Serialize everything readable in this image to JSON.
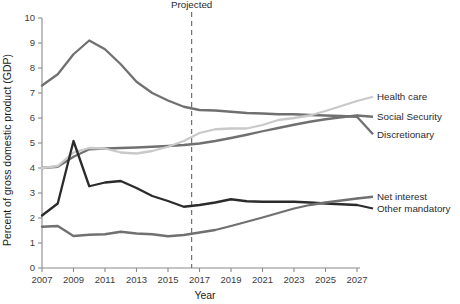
{
  "chart_data": {
    "type": "line",
    "title": "",
    "xlabel": "Year",
    "ylabel": "Percent of gross domestic product (GDP)",
    "xlim": [
      2007,
      2027
    ],
    "ylim": [
      0,
      10
    ],
    "grid": false,
    "legend_position": "right-inline",
    "x": [
      2007,
      2008,
      2009,
      2010,
      2011,
      2012,
      2013,
      2014,
      2015,
      2016,
      2017,
      2018,
      2019,
      2020,
      2021,
      2022,
      2023,
      2024,
      2025,
      2026,
      2027
    ],
    "xticks": [
      2007,
      2009,
      2011,
      2013,
      2015,
      2017,
      2019,
      2021,
      2023,
      2025,
      2027
    ],
    "yticks": [
      0,
      1,
      2,
      3,
      4,
      5,
      6,
      7,
      8,
      9,
      10
    ],
    "annotations": [
      {
        "text": "Projected",
        "x": 2016.5,
        "type": "vertical-dashed-line"
      }
    ],
    "series": [
      {
        "name": "Discretionary",
        "color": "#707070",
        "width": 2.3,
        "label_y": 5.35,
        "values": [
          7.3,
          7.75,
          8.55,
          9.1,
          8.75,
          8.15,
          7.45,
          7.0,
          6.7,
          6.45,
          6.32,
          6.3,
          6.25,
          6.2,
          6.18,
          6.15,
          6.15,
          6.12,
          6.1,
          6.08,
          6.05
        ]
      },
      {
        "name": "Social Security",
        "color": "#707070",
        "width": 2.3,
        "label_y": 6.05,
        "values": [
          4.0,
          4.05,
          4.45,
          4.75,
          4.78,
          4.8,
          4.82,
          4.85,
          4.88,
          4.92,
          4.98,
          5.08,
          5.2,
          5.33,
          5.47,
          5.6,
          5.73,
          5.85,
          5.95,
          6.03,
          6.1
        ]
      },
      {
        "name": "Health care",
        "color": "#c9c9c9",
        "width": 2.3,
        "label_y": 6.85,
        "values": [
          4.0,
          4.08,
          4.62,
          4.8,
          4.78,
          4.62,
          4.58,
          4.68,
          4.85,
          5.08,
          5.4,
          5.55,
          5.58,
          5.58,
          5.72,
          5.92,
          6.0,
          6.1,
          6.28,
          6.48,
          6.68
        ]
      },
      {
        "name": "Other mandatory",
        "color": "#2b2b2b",
        "width": 2.3,
        "label_y": 2.38,
        "values": [
          2.1,
          2.58,
          5.08,
          3.27,
          3.42,
          3.48,
          3.2,
          2.88,
          2.68,
          2.45,
          2.52,
          2.62,
          2.75,
          2.67,
          2.65,
          2.65,
          2.65,
          2.62,
          2.58,
          2.55,
          2.52
        ]
      },
      {
        "name": "Net interest",
        "color": "#707070",
        "width": 2.3,
        "label_y": 2.85,
        "values": [
          1.65,
          1.68,
          1.28,
          1.33,
          1.35,
          1.45,
          1.38,
          1.35,
          1.27,
          1.32,
          1.42,
          1.52,
          1.68,
          1.85,
          2.02,
          2.2,
          2.38,
          2.52,
          2.62,
          2.7,
          2.78
        ]
      }
    ]
  },
  "colors": {
    "axis": "#8a8a8a",
    "text": "#2b2b2b",
    "light_gray_series": "#c9c9c9",
    "mid_gray_series": "#707070",
    "dark_series": "#2b2b2b"
  }
}
